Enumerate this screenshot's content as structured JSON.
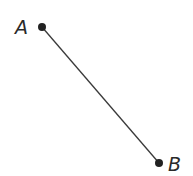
{
  "diagram": {
    "type": "line-segment",
    "points": [
      {
        "label": "A",
        "x": 42,
        "y": 27
      },
      {
        "label": "B",
        "x": 159,
        "y": 163
      }
    ],
    "colors": {
      "line": "#3a3a3a",
      "point": "#222222",
      "label": "#2a2a2a"
    }
  }
}
